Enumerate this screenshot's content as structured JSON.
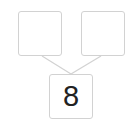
{
  "diagram": {
    "type": "number-bond",
    "parts": [
      {
        "position": "top-left",
        "value": ""
      },
      {
        "position": "top-right",
        "value": ""
      }
    ],
    "whole": {
      "position": "bottom",
      "value": "8"
    }
  },
  "colors": {
    "box_border": "#d2d2d2",
    "connector": "#d2d2d2",
    "text": "#222222",
    "background": "#ffffff"
  }
}
